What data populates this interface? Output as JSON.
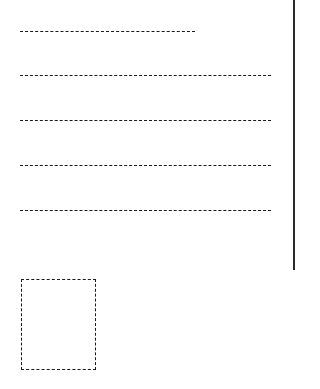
{
  "form": {
    "title": "Address form",
    "lines": [
      {
        "id": "line-1",
        "value": "",
        "top": 31,
        "width": 175
      },
      {
        "id": "line-2",
        "value": "",
        "top": 75,
        "width": 251
      },
      {
        "id": "line-3",
        "value": "",
        "top": 120,
        "width": 251
      },
      {
        "id": "line-4",
        "value": "",
        "top": 165,
        "width": 251
      },
      {
        "id": "line-5",
        "value": "",
        "top": 210,
        "width": 251
      }
    ],
    "stamp_box": {
      "label": ""
    }
  },
  "colors": {
    "ink": "#1a1a1a",
    "rule": "#2a2a2a",
    "background": "#ffffff"
  }
}
